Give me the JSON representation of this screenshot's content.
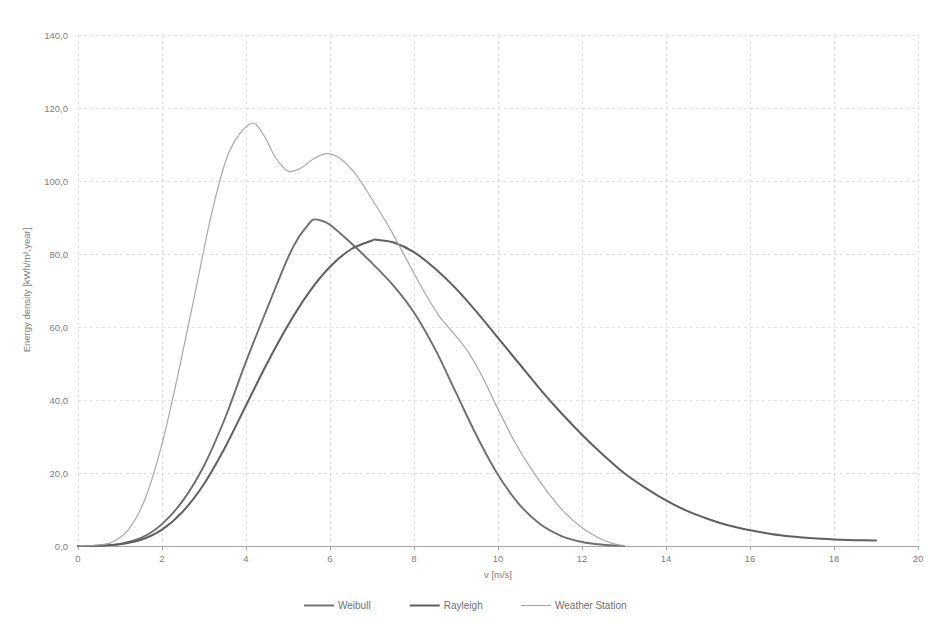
{
  "chart_data": {
    "type": "line",
    "title": "",
    "xlabel": "v [m/s]",
    "ylabel": "Energy density [kWh/m²,year]",
    "xlim": [
      0,
      20
    ],
    "ylim": [
      0,
      140
    ],
    "xticks": [
      "0",
      "2",
      "4",
      "6",
      "8",
      "10",
      "12",
      "14",
      "16",
      "18",
      "20"
    ],
    "xtick_values": [
      0,
      2,
      4,
      6,
      8,
      10,
      12,
      14,
      16,
      18,
      20
    ],
    "yticks": [
      "0,0",
      "20,0",
      "40,0",
      "60,0",
      "80,0",
      "100,0",
      "120,0",
      "140,0"
    ],
    "ytick_values": [
      0,
      20,
      40,
      60,
      80,
      100,
      120,
      140
    ],
    "grid": true,
    "legend_position": "bottom",
    "series": [
      {
        "name": "Weibull",
        "color": "#6e6e6e",
        "width": 1.9,
        "x": [
          0,
          0.5,
          1,
          1.5,
          2,
          2.5,
          3,
          3.5,
          4,
          4.5,
          5,
          5.25,
          5.5,
          5.6,
          5.75,
          6,
          6.5,
          7,
          7.5,
          8,
          8.5,
          9,
          9.5,
          10,
          10.5,
          11,
          11.5,
          12,
          12.5,
          13
        ],
        "y": [
          0,
          0.1,
          0.6,
          2.2,
          6.0,
          12.5,
          22.0,
          35.0,
          50.5,
          65.0,
          79.0,
          84.5,
          88.3,
          89.4,
          89.3,
          88.0,
          83.0,
          77.5,
          71.5,
          64.0,
          54.0,
          42.0,
          30.0,
          19.5,
          11.5,
          6.0,
          2.8,
          1.1,
          0.35,
          0.0
        ]
      },
      {
        "name": "Rayleigh",
        "color": "#5f5f5f",
        "width": 2.0,
        "x": [
          0,
          0.5,
          1,
          1.5,
          2,
          2.5,
          3,
          3.5,
          4,
          4.5,
          5,
          5.5,
          6,
          6.5,
          7,
          7.1,
          7.5,
          8,
          8.5,
          9,
          9.5,
          10,
          10.5,
          11,
          11.5,
          12,
          12.5,
          13,
          13.5,
          14,
          14.5,
          15,
          15.5,
          16,
          16.5,
          17,
          17.5,
          18,
          18.5,
          19
        ],
        "y": [
          0,
          0.1,
          0.5,
          1.7,
          4.5,
          9.5,
          17.0,
          27.0,
          38.5,
          50.0,
          60.5,
          69.5,
          76.5,
          81.3,
          83.7,
          83.9,
          83.2,
          80.5,
          76.0,
          70.5,
          64.0,
          57.0,
          50.0,
          43.0,
          36.5,
          30.5,
          25.0,
          20.0,
          16.0,
          12.5,
          9.6,
          7.4,
          5.6,
          4.3,
          3.3,
          2.6,
          2.1,
          1.8,
          1.6,
          1.5
        ]
      },
      {
        "name": "Weather Station",
        "color": "#a8a8a8",
        "width": 1.2,
        "x": [
          0,
          0.4,
          0.8,
          1.2,
          1.6,
          2.0,
          2.4,
          2.8,
          3.2,
          3.6,
          4.1,
          4.4,
          4.7,
          5.0,
          5.3,
          5.6,
          5.9,
          6.2,
          6.6,
          7.0,
          7.4,
          7.8,
          8.2,
          8.6,
          9.0,
          9.3,
          9.6,
          10.0,
          10.4,
          10.8,
          11.2,
          11.6,
          12.0,
          12.4,
          12.7,
          13.0
        ],
        "y": [
          0,
          0.2,
          1.0,
          4.5,
          13.0,
          28.0,
          48.0,
          70.0,
          92.0,
          108.0,
          115.7,
          113.0,
          106.5,
          102.7,
          103.5,
          106.0,
          107.5,
          106.5,
          102.0,
          95.0,
          87.5,
          79.0,
          70.5,
          63.0,
          57.5,
          53.0,
          47.0,
          37.5,
          28.5,
          21.0,
          14.5,
          9.0,
          5.0,
          2.2,
          0.8,
          0.0
        ]
      }
    ]
  },
  "legend": {
    "items": [
      {
        "label": "Weibull"
      },
      {
        "label": "Rayleigh"
      },
      {
        "label": "Weather Station"
      }
    ]
  },
  "axes": {
    "x_title": "v [m/s]",
    "y_title": "Energy density [kWh/m²,year]"
  }
}
